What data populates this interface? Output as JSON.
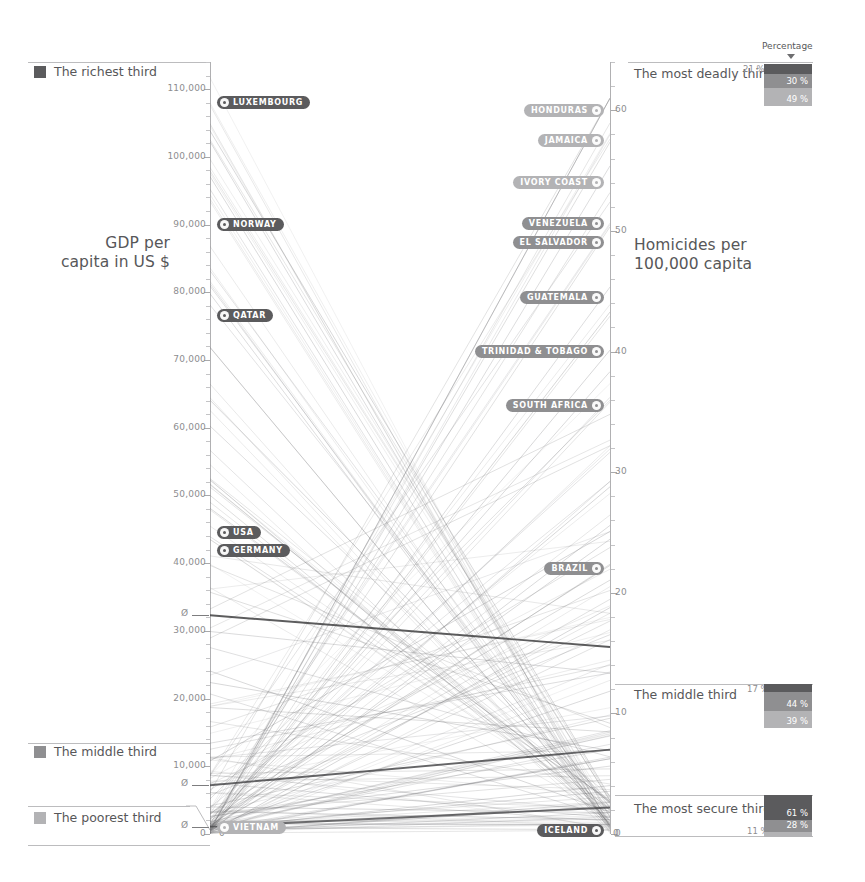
{
  "chart_data": {
    "type": "line",
    "subtype": "slopegraph",
    "title": "",
    "axes": [
      {
        "id": "left",
        "label": "GDP per\ncapita in US $",
        "unit": "US $",
        "min": 0,
        "max": 114000,
        "ticks": [
          "110,000",
          "100,000",
          "90,000",
          "80,000",
          "70,000",
          "60,000",
          "50,000",
          "40,000",
          "30,000",
          "20,000",
          "10,000",
          "0"
        ],
        "tick_values": [
          110000,
          100000,
          90000,
          80000,
          70000,
          60000,
          50000,
          40000,
          30000,
          20000,
          10000,
          0
        ],
        "average_markers": [
          {
            "label": "Ø",
            "value": 32300
          },
          {
            "label": "Ø",
            "value": 7200
          },
          {
            "label": "Ø",
            "value": 1100
          }
        ]
      },
      {
        "id": "right",
        "label": "Homicides per\n100,000 capita",
        "unit": "per 100,000",
        "min": 0,
        "max": 64,
        "ticks": [
          "60",
          "50",
          "40",
          "30",
          "20",
          "10",
          "0"
        ],
        "tick_values": [
          60,
          50,
          40,
          30,
          20,
          10,
          0
        ]
      }
    ],
    "highlighted_countries": [
      {
        "name": "LUXEMBOURG",
        "side": "left",
        "gdp": 108000,
        "tone": "dark"
      },
      {
        "name": "NORWAY",
        "side": "left",
        "gdp": 90000,
        "tone": "dark"
      },
      {
        "name": "QATAR",
        "side": "left",
        "gdp": 76500,
        "tone": "dark"
      },
      {
        "name": "USA",
        "side": "left",
        "gdp": 44500,
        "tone": "dark"
      },
      {
        "name": "GERMANY",
        "side": "left",
        "gdp": 41800,
        "tone": "dark"
      },
      {
        "name": "VIETNAM",
        "side": "left",
        "gdp": 900,
        "tone": "light"
      },
      {
        "name": "HONDURAS",
        "side": "right",
        "homicides": 60.0,
        "tone": "light"
      },
      {
        "name": "JAMAICA",
        "side": "right",
        "homicides": 57.5,
        "tone": "light"
      },
      {
        "name": "IVORY COAST",
        "side": "right",
        "homicides": 54.0,
        "tone": "light"
      },
      {
        "name": "VENEZUELA",
        "side": "right",
        "homicides": 50.6,
        "tone": "mid"
      },
      {
        "name": "EL SALVADOR",
        "side": "right",
        "homicides": 49.0,
        "tone": "mid"
      },
      {
        "name": "GUATEMALA",
        "side": "right",
        "homicides": 44.5,
        "tone": "mid"
      },
      {
        "name": "TRINIDAD & TOBAGO",
        "side": "right",
        "homicides": 40.0,
        "tone": "mid"
      },
      {
        "name": "SOUTH AFRICA",
        "side": "right",
        "homicides": 35.5,
        "tone": "mid"
      },
      {
        "name": "BRAZIL",
        "side": "right",
        "homicides": 22.0,
        "tone": "mid"
      },
      {
        "name": "ICELAND",
        "side": "right",
        "homicides": 0.3,
        "tone": "dark"
      }
    ],
    "left_groups": [
      {
        "label": "The richest third",
        "tone": "dark",
        "color": "#5b5b5d"
      },
      {
        "label": "The middle third",
        "tone": "mid",
        "color": "#8f8f91"
      },
      {
        "label": "The poorest third",
        "tone": "light",
        "color": "#b3b3b5"
      }
    ],
    "right_groups": [
      {
        "label": "The most deadly third",
        "outside_pct": "21 %",
        "segments": [
          {
            "value": "21 %",
            "pct": 21,
            "color": "#5b5b5d",
            "show_inside": false
          },
          {
            "value": "30 %",
            "pct": 30,
            "color": "#8f8f91",
            "show_inside": true
          },
          {
            "value": "49 %",
            "pct": 49,
            "color": "#b3b3b5",
            "show_inside": true
          }
        ]
      },
      {
        "label": "The middle third",
        "outside_pct": "17 %",
        "segments": [
          {
            "value": "17 %",
            "pct": 17,
            "color": "#5b5b5d",
            "show_inside": false
          },
          {
            "value": "44 %",
            "pct": 44,
            "color": "#8f8f91",
            "show_inside": true
          },
          {
            "value": "39 %",
            "pct": 39,
            "color": "#b3b3b5",
            "show_inside": true
          }
        ]
      },
      {
        "label": "The most secure third",
        "outside_pct": "11 %",
        "segments": [
          {
            "value": "61 %",
            "pct": 61,
            "color": "#5b5b5d",
            "show_inside": true
          },
          {
            "value": "28 %",
            "pct": 28,
            "color": "#8f8f91",
            "show_inside": true
          },
          {
            "value": "11 %",
            "pct": 11,
            "color": "#b3b3b5",
            "show_inside": false
          }
        ]
      }
    ],
    "percentage_header": "Percentage",
    "legend_position": "right",
    "grid": false
  },
  "left_axis": {
    "title_line1": "GDP per",
    "title_line2": "capita in US $",
    "ticks": [
      "110,000",
      "100,000",
      "90,000",
      "80,000",
      "70,000",
      "60,000",
      "50,000",
      "40,000",
      "30,000",
      "20,000",
      "10,000",
      "0"
    ],
    "avg_symbol": "Ø"
  },
  "right_axis": {
    "title_line1": "Homicides per",
    "title_line2": "100,000 capita",
    "ticks": [
      "60",
      "50",
      "40",
      "30",
      "20",
      "10",
      "0"
    ]
  },
  "left_legend": {
    "items": [
      {
        "label": "The richest third"
      },
      {
        "label": "The middle third"
      },
      {
        "label": "The poorest third"
      }
    ]
  },
  "right_legend": {
    "header": "Percentage",
    "items": [
      {
        "label": "The most deadly third",
        "outside": "21 %",
        "s1": "21 %",
        "s2": "30 %",
        "s3": "49 %"
      },
      {
        "label": "The middle third",
        "outside": "17 %",
        "s1": "17 %",
        "s2": "44 %",
        "s3": "39 %"
      },
      {
        "label": "The most secure third",
        "outside": "11 %",
        "s1": "61 %",
        "s2": "28 %",
        "s3": "11 %"
      }
    ]
  },
  "pills": {
    "luxembourg": "LUXEMBOURG",
    "norway": "NORWAY",
    "qatar": "QATAR",
    "usa": "USA",
    "germany": "GERMANY",
    "vietnam": "VIETNAM",
    "honduras": "HONDURAS",
    "jamaica": "JAMAICA",
    "ivory_coast": "IVORY COAST",
    "venezuela": "VENEZUELA",
    "el_salvador": "EL SALVADOR",
    "guatemala": "GUATEMALA",
    "trinidad": "TRINIDAD & TOBAGO",
    "south_africa": "SOUTH AFRICA",
    "brazil": "BRAZIL",
    "iceland": "ICELAND"
  },
  "colors": {
    "dark": "#5b5b5d",
    "mid": "#8f8f91",
    "light": "#b3b3b5",
    "rule": "#bcbcbe",
    "text": "#575759",
    "tick_text": "#8d8d8f"
  }
}
